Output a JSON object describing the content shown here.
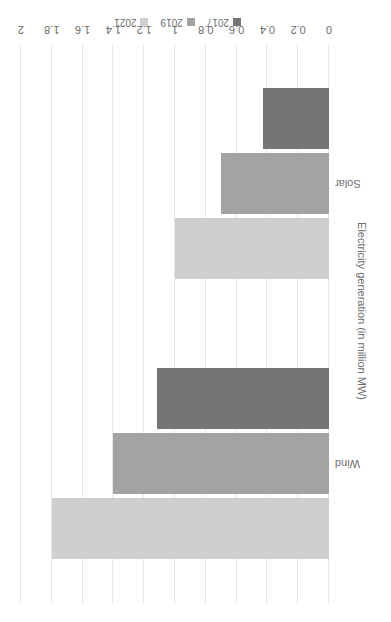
{
  "chart_data": {
    "type": "bar",
    "orientation": "horizontal",
    "title": "",
    "xlabel": "Electricity generation (in million MW)",
    "ylabel": "",
    "categories": [
      "Wind",
      "Solar"
    ],
    "series": [
      {
        "name": "2017",
        "color": "#757575",
        "values": [
          1.12,
          0.43
        ]
      },
      {
        "name": "2019",
        "color": "#a3a3a3",
        "values": [
          1.4,
          0.7
        ]
      },
      {
        "name": "2021",
        "color": "#cfcfcf",
        "values": [
          1.8,
          1.0
        ]
      }
    ],
    "xlim": [
      0,
      2
    ],
    "tick_labels": [
      "0",
      "0.2",
      "0.4",
      "0.6",
      "0.8",
      "1",
      "1.2",
      "1.4",
      "1.6",
      "1.8",
      "2"
    ],
    "tick_values": [
      0,
      0.2,
      0.4,
      0.6,
      0.8,
      1,
      1.2,
      1.4,
      1.6,
      1.8,
      2
    ],
    "grid": true,
    "legend_position": "bottom",
    "rotation_deg": 180
  }
}
